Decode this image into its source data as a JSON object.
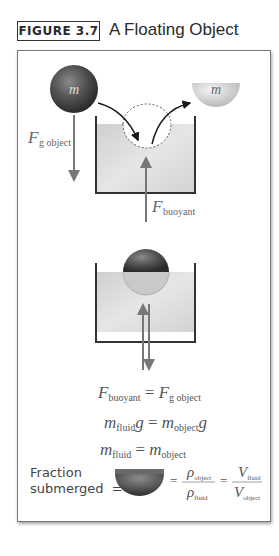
{
  "figure": {
    "label": "FIGURE 3.7",
    "title": "A Floating Object"
  },
  "diagram_top": {
    "object_mass_label": "m",
    "displaced_mass_label": "m",
    "gravity_force_label": "F",
    "gravity_force_sub": "g object",
    "buoyant_force_label": "F",
    "buoyant_force_sub": "buoyant"
  },
  "equations": {
    "eq1": {
      "lhs": "F",
      "lhs_sub": "buoyant",
      "op": " = ",
      "rhs": "F",
      "rhs_sub": "g object"
    },
    "eq2": {
      "lhs": "m",
      "lhs_sub": "fluid",
      "lhs_tail": "g",
      "op": " = ",
      "rhs": "m",
      "rhs_sub": "object",
      "rhs_tail": "g"
    },
    "eq3": {
      "lhs": "m",
      "lhs_sub": "fluid",
      "op": " = ",
      "rhs": "m",
      "rhs_sub": "object"
    }
  },
  "fraction": {
    "label_line1": "Fraction",
    "label_line2": "submerged",
    "equals": "=",
    "rho": "ρ",
    "rho_object_sub": "object",
    "rho_fluid_sub": "fluid",
    "V": "V",
    "V_fluid_sub": "fluid",
    "V_object_sub": "object"
  },
  "colors": {
    "water": "#d9d9d9",
    "container": "#333333",
    "arrow": "#777777",
    "text": "#555555"
  }
}
